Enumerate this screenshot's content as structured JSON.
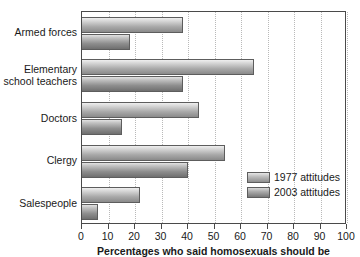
{
  "chart_data": {
    "type": "bar",
    "orientation": "horizontal",
    "title": "",
    "xlabel": "Percentages who said homosexuals should be",
    "ylabel": "",
    "xlim": [
      0,
      100
    ],
    "grid": true,
    "legend_position": "inside-lower-right",
    "categories": [
      "Armed forces",
      "Elementary\nschool teachers",
      "Doctors",
      "Clergy",
      "Salespeople"
    ],
    "series": [
      {
        "name": "1977 attitudes",
        "color": "#b4b4b4",
        "values": [
          38,
          65,
          44,
          54,
          22
        ]
      },
      {
        "name": "2003 attitudes",
        "color": "#8c8c8c",
        "values": [
          18,
          38,
          15,
          40,
          6
        ]
      }
    ],
    "xticks": [
      0,
      10,
      20,
      30,
      40,
      50,
      60,
      70,
      80,
      90,
      100
    ],
    "xtick_labels": [
      "0",
      "10",
      "20",
      "30",
      "40",
      "50",
      "60",
      "70",
      "80",
      "90",
      "100"
    ]
  },
  "legend": {
    "items": [
      {
        "label": "1977 attitudes"
      },
      {
        "label": "2003 attitudes"
      }
    ]
  }
}
